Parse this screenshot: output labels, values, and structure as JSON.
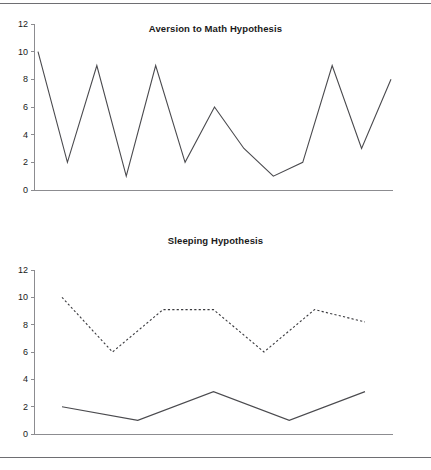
{
  "page": {
    "background": "#ffffff",
    "rule_color": "#6e6e72",
    "line_color": "#4a4a4e"
  },
  "charts": [
    {
      "id": "aversion-to-math-hypothesis",
      "title": "Aversion to Math Hypothesis",
      "yticks": [
        "0",
        "2",
        "4",
        "6",
        "8",
        "10",
        "12"
      ]
    },
    {
      "id": "sleeping-hypothesis",
      "title": "Sleeping Hypothesis",
      "yticks": [
        "0",
        "2",
        "4",
        "6",
        "8",
        "10",
        "12"
      ]
    }
  ],
  "chart_data": [
    {
      "type": "line",
      "title": "Aversion to Math Hypothesis",
      "xlabel": "",
      "ylabel": "",
      "ylim": [
        0,
        12
      ],
      "yticks": [
        0,
        2,
        4,
        6,
        8,
        10,
        12
      ],
      "grid": false,
      "legend": "none",
      "x": [
        1,
        2,
        3,
        4,
        5,
        6,
        7,
        8,
        9,
        10,
        11,
        12,
        13
      ],
      "series": [
        {
          "name": "aversion",
          "style": "solid",
          "values": [
            10,
            2,
            9,
            1,
            9,
            2,
            6,
            3,
            1,
            2,
            9,
            3,
            8
          ]
        }
      ]
    },
    {
      "type": "line",
      "title": "Sleeping Hypothesis",
      "xlabel": "",
      "ylabel": "",
      "ylim": [
        0,
        12
      ],
      "yticks": [
        0,
        2,
        4,
        6,
        8,
        10,
        12
      ],
      "grid": false,
      "legend": "none",
      "x": [
        1,
        2,
        3,
        4,
        5,
        6,
        7
      ],
      "series": [
        {
          "name": "dashed-series",
          "style": "dashed",
          "values": [
            10,
            6,
            9.1,
            9.1,
            6,
            9.1,
            8.2
          ]
        },
        {
          "name": "solid-series",
          "style": "solid",
          "values": [
            2,
            1,
            3.1,
            1,
            3.1
          ]
        }
      ]
    }
  ]
}
